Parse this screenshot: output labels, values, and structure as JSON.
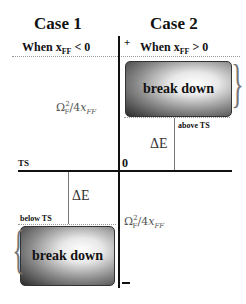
{
  "headers": {
    "case1": "Case 1",
    "case2": "Case 2"
  },
  "conditions": {
    "case1": "When x",
    "case1_sub": "FF",
    "case1_rel": " < 0",
    "case2": "When x",
    "case2_sub": "FF",
    "case2_rel": " > 0"
  },
  "axis": {
    "plus": "+",
    "minus": "−",
    "zero": "0",
    "ts": "TS"
  },
  "boxes": {
    "top": "break down",
    "bottom": "break down"
  },
  "labels": {
    "above_ts": "above TS",
    "below_ts": "below TS",
    "delta_e_top": "ΔE",
    "delta_e_bottom": "ΔE",
    "omega_top": "Ω²F/4x_FF",
    "omega_bottom": "Ω²F/4x_FF"
  }
}
